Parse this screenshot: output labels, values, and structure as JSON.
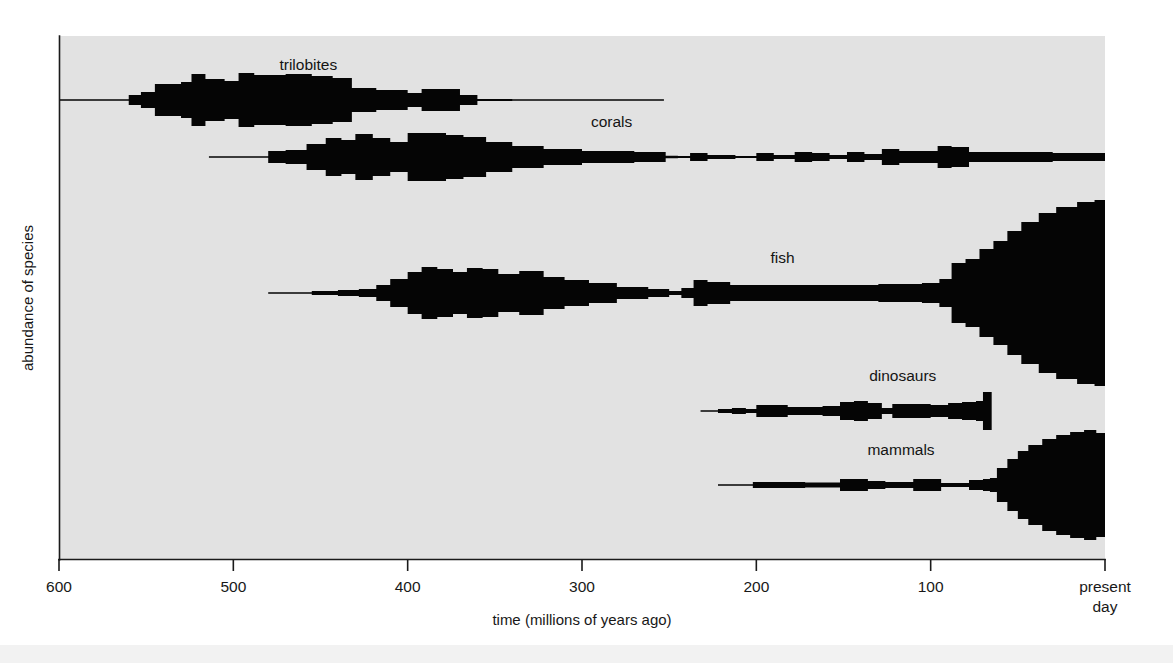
{
  "figure": {
    "background_color": "#ffffff",
    "plot_background_color": "#e2e2e2",
    "band_color": "#050505",
    "axis_color": "#1a1a1a"
  },
  "chart_data": {
    "type": "area",
    "title": "",
    "subtitle": "",
    "xlabel": "time (millions of years ago)",
    "ylabel": "abundance of species",
    "xlim": [
      600,
      0
    ],
    "x_tick_labels": [
      "600",
      "500",
      "400",
      "300",
      "200",
      "100",
      "present day"
    ],
    "x_ticks": [
      600,
      500,
      400,
      300,
      200,
      100,
      0
    ],
    "x_axis_direction": "decreasing-left-to-right",
    "grid": false,
    "legend": "inline-labels",
    "y_axis_ticks": false,
    "annotations": [
      {
        "text": "trilobites",
        "x": 457,
        "series": "trilobites"
      },
      {
        "text": "corals",
        "x": 283,
        "series": "corals"
      },
      {
        "text": "fish",
        "x": 185,
        "series": "fish"
      },
      {
        "text": "dinosaurs",
        "x": 116,
        "series": "dinosaurs"
      },
      {
        "text": "mammals",
        "x": 117,
        "series": "mammals"
      }
    ],
    "series": [
      {
        "name": "trilobites",
        "label": "trilobites",
        "baseline_y": 100,
        "start_mya": 600,
        "end_mya": 253,
        "extinct": true,
        "note": "spindle peaks in Cambrian-Ordovician, extinct at end-Permian",
        "points": [
          {
            "mya": 600,
            "abundance": 0.5
          },
          {
            "mya": 565,
            "abundance": 0.6
          },
          {
            "mya": 560,
            "abundance": 5
          },
          {
            "mya": 553,
            "abundance": 8
          },
          {
            "mya": 545,
            "abundance": 16
          },
          {
            "mya": 530,
            "abundance": 18
          },
          {
            "mya": 524,
            "abundance": 26
          },
          {
            "mya": 516,
            "abundance": 21
          },
          {
            "mya": 505,
            "abundance": 19
          },
          {
            "mya": 497,
            "abundance": 27
          },
          {
            "mya": 488,
            "abundance": 25
          },
          {
            "mya": 470,
            "abundance": 26
          },
          {
            "mya": 455,
            "abundance": 24
          },
          {
            "mya": 443,
            "abundance": 22
          },
          {
            "mya": 432,
            "abundance": 12
          },
          {
            "mya": 418,
            "abundance": 10
          },
          {
            "mya": 400,
            "abundance": 7
          },
          {
            "mya": 392,
            "abundance": 11
          },
          {
            "mya": 378,
            "abundance": 11
          },
          {
            "mya": 370,
            "abundance": 5
          },
          {
            "mya": 360,
            "abundance": 1
          },
          {
            "mya": 340,
            "abundance": 0.6
          },
          {
            "mya": 253,
            "abundance": 0.5
          }
        ]
      },
      {
        "name": "corals",
        "label": "corals",
        "baseline_y": 157,
        "start_mya": 514,
        "end_mya": 0,
        "extinct": false,
        "note": "Palaeozoic spindle, end-Permian crash, Mesozoic-Cenozoic recovery",
        "points": [
          {
            "mya": 514,
            "abundance": 0.5
          },
          {
            "mya": 486,
            "abundance": 0.8
          },
          {
            "mya": 480,
            "abundance": 6
          },
          {
            "mya": 470,
            "abundance": 7
          },
          {
            "mya": 458,
            "abundance": 13
          },
          {
            "mya": 447,
            "abundance": 19
          },
          {
            "mya": 438,
            "abundance": 17
          },
          {
            "mya": 430,
            "abundance": 23
          },
          {
            "mya": 420,
            "abundance": 19
          },
          {
            "mya": 410,
            "abundance": 15
          },
          {
            "mya": 400,
            "abundance": 24
          },
          {
            "mya": 390,
            "abundance": 24
          },
          {
            "mya": 378,
            "abundance": 22
          },
          {
            "mya": 368,
            "abundance": 20
          },
          {
            "mya": 355,
            "abundance": 15
          },
          {
            "mya": 340,
            "abundance": 11
          },
          {
            "mya": 322,
            "abundance": 8
          },
          {
            "mya": 300,
            "abundance": 6
          },
          {
            "mya": 270,
            "abundance": 5
          },
          {
            "mya": 252,
            "abundance": 1.2
          },
          {
            "mya": 245,
            "abundance": 1
          },
          {
            "mya": 238,
            "abundance": 4
          },
          {
            "mya": 228,
            "abundance": 2
          },
          {
            "mya": 212,
            "abundance": 1
          },
          {
            "mya": 200,
            "abundance": 4
          },
          {
            "mya": 190,
            "abundance": 2
          },
          {
            "mya": 178,
            "abundance": 5
          },
          {
            "mya": 168,
            "abundance": 4
          },
          {
            "mya": 158,
            "abundance": 2
          },
          {
            "mya": 148,
            "abundance": 5
          },
          {
            "mya": 138,
            "abundance": 3
          },
          {
            "mya": 128,
            "abundance": 8
          },
          {
            "mya": 118,
            "abundance": 6
          },
          {
            "mya": 105,
            "abundance": 6
          },
          {
            "mya": 96,
            "abundance": 11
          },
          {
            "mya": 88,
            "abundance": 10
          },
          {
            "mya": 78,
            "abundance": 5
          },
          {
            "mya": 60,
            "abundance": 5
          },
          {
            "mya": 30,
            "abundance": 4
          },
          {
            "mya": 0,
            "abundance": 4
          }
        ]
      },
      {
        "name": "fish",
        "label": "fish",
        "baseline_y": 293,
        "start_mya": 480,
        "end_mya": 0,
        "extinct": false,
        "note": "Devonian spindle, end-Devonian dip, huge Cenozoic radiation",
        "points": [
          {
            "mya": 480,
            "abundance": 0.6
          },
          {
            "mya": 455,
            "abundance": 2
          },
          {
            "mya": 440,
            "abundance": 3
          },
          {
            "mya": 428,
            "abundance": 4
          },
          {
            "mya": 418,
            "abundance": 8
          },
          {
            "mya": 410,
            "abundance": 14
          },
          {
            "mya": 400,
            "abundance": 21
          },
          {
            "mya": 392,
            "abundance": 26
          },
          {
            "mya": 383,
            "abundance": 24
          },
          {
            "mya": 374,
            "abundance": 21
          },
          {
            "mya": 366,
            "abundance": 25
          },
          {
            "mya": 357,
            "abundance": 24
          },
          {
            "mya": 348,
            "abundance": 19
          },
          {
            "mya": 336,
            "abundance": 22
          },
          {
            "mya": 322,
            "abundance": 16
          },
          {
            "mya": 310,
            "abundance": 13
          },
          {
            "mya": 296,
            "abundance": 10
          },
          {
            "mya": 280,
            "abundance": 6
          },
          {
            "mya": 262,
            "abundance": 4
          },
          {
            "mya": 250,
            "abundance": 2
          },
          {
            "mya": 243,
            "abundance": 5
          },
          {
            "mya": 236,
            "abundance": 13
          },
          {
            "mya": 228,
            "abundance": 11
          },
          {
            "mya": 215,
            "abundance": 8
          },
          {
            "mya": 195,
            "abundance": 8
          },
          {
            "mya": 165,
            "abundance": 8
          },
          {
            "mya": 130,
            "abundance": 9
          },
          {
            "mya": 105,
            "abundance": 10
          },
          {
            "mya": 95,
            "abundance": 14
          },
          {
            "mya": 88,
            "abundance": 30
          },
          {
            "mya": 80,
            "abundance": 34
          },
          {
            "mya": 72,
            "abundance": 44
          },
          {
            "mya": 64,
            "abundance": 52
          },
          {
            "mya": 56,
            "abundance": 62
          },
          {
            "mya": 48,
            "abundance": 71
          },
          {
            "mya": 38,
            "abundance": 80
          },
          {
            "mya": 28,
            "abundance": 86
          },
          {
            "mya": 16,
            "abundance": 91
          },
          {
            "mya": 6,
            "abundance": 93
          },
          {
            "mya": 0,
            "abundance": 93
          }
        ]
      },
      {
        "name": "dinosaurs",
        "label": "dinosaurs",
        "baseline_y": 411,
        "start_mya": 232,
        "end_mya": 65,
        "extinct": true,
        "note": "Triassic origin, peak in Cretaceous, abrupt end-Cretaceous extinction",
        "points": [
          {
            "mya": 232,
            "abundance": 0.5
          },
          {
            "mya": 222,
            "abundance": 2
          },
          {
            "mya": 214,
            "abundance": 3
          },
          {
            "mya": 206,
            "abundance": 2
          },
          {
            "mya": 200,
            "abundance": 6
          },
          {
            "mya": 190,
            "abundance": 6
          },
          {
            "mya": 182,
            "abundance": 4
          },
          {
            "mya": 172,
            "abundance": 4
          },
          {
            "mya": 162,
            "abundance": 5
          },
          {
            "mya": 152,
            "abundance": 9
          },
          {
            "mya": 144,
            "abundance": 10
          },
          {
            "mya": 136,
            "abundance": 8
          },
          {
            "mya": 128,
            "abundance": 3
          },
          {
            "mya": 122,
            "abundance": 7
          },
          {
            "mya": 112,
            "abundance": 7
          },
          {
            "mya": 100,
            "abundance": 6
          },
          {
            "mya": 90,
            "abundance": 8
          },
          {
            "mya": 82,
            "abundance": 9
          },
          {
            "mya": 74,
            "abundance": 10
          },
          {
            "mya": 70,
            "abundance": 19
          },
          {
            "mya": 65.5,
            "abundance": 19
          },
          {
            "mya": 65,
            "abundance": 19
          }
        ]
      },
      {
        "name": "mammals",
        "label": "mammals",
        "baseline_y": 485,
        "start_mya": 222,
        "end_mya": 0,
        "extinct": false,
        "note": "Mesozoic thin line, explosive Cenozoic radiation after dinosaurs die out",
        "points": [
          {
            "mya": 222,
            "abundance": 0.5
          },
          {
            "mya": 210,
            "abundance": 0.8
          },
          {
            "mya": 202,
            "abundance": 3
          },
          {
            "mya": 188,
            "abundance": 3
          },
          {
            "mya": 172,
            "abundance": 2.5
          },
          {
            "mya": 160,
            "abundance": 2.5
          },
          {
            "mya": 152,
            "abundance": 6
          },
          {
            "mya": 144,
            "abundance": 6
          },
          {
            "mya": 136,
            "abundance": 4
          },
          {
            "mya": 126,
            "abundance": 3
          },
          {
            "mya": 118,
            "abundance": 3
          },
          {
            "mya": 110,
            "abundance": 6
          },
          {
            "mya": 102,
            "abundance": 6
          },
          {
            "mya": 94,
            "abundance": 2
          },
          {
            "mya": 86,
            "abundance": 2
          },
          {
            "mya": 78,
            "abundance": 5
          },
          {
            "mya": 70,
            "abundance": 6
          },
          {
            "mya": 66,
            "abundance": 7
          },
          {
            "mya": 62,
            "abundance": 17
          },
          {
            "mya": 56,
            "abundance": 26
          },
          {
            "mya": 50,
            "abundance": 34
          },
          {
            "mya": 44,
            "abundance": 40
          },
          {
            "mya": 36,
            "abundance": 46
          },
          {
            "mya": 28,
            "abundance": 50
          },
          {
            "mya": 20,
            "abundance": 53
          },
          {
            "mya": 12,
            "abundance": 55
          },
          {
            "mya": 5,
            "abundance": 52
          },
          {
            "mya": 0,
            "abundance": 48
          }
        ]
      }
    ]
  }
}
